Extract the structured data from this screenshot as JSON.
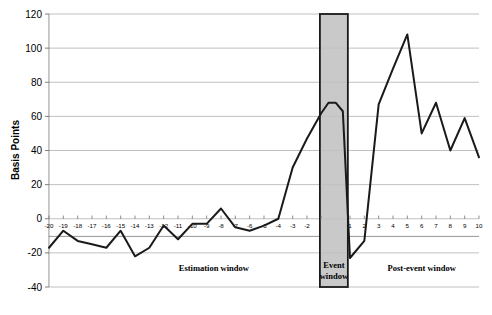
{
  "chart_data": {
    "type": "line",
    "title": "",
    "xlabel": "",
    "ylabel": "Basis Points",
    "xlim": [
      -20,
      10
    ],
    "ylim": [
      -40,
      120
    ],
    "grid": true,
    "legend": "none",
    "ytick_labels": [
      "120",
      "100",
      "80",
      "60",
      "40",
      "20",
      "0",
      "-20",
      "-40"
    ],
    "ytick_values": [
      120,
      100,
      80,
      60,
      40,
      20,
      0,
      -20,
      -40
    ],
    "xtick_labels": [
      "-20",
      "-19",
      "-18",
      "-17",
      "-16",
      "-15",
      "-14",
      "-13",
      "-12",
      "-11",
      "-10",
      "-9",
      "-8",
      "-7",
      "-6",
      "-5",
      "-4",
      "-3",
      "-2",
      "-1",
      "1",
      "2",
      "3",
      "4",
      "5",
      "6",
      "7",
      "8",
      "9",
      "10"
    ],
    "xtick_values": [
      -20,
      -19,
      -18,
      -17,
      -16,
      -15,
      -14,
      -13,
      -12,
      -11,
      -10,
      -9,
      -8,
      -7,
      -6,
      -5,
      -4,
      -3,
      -2,
      -1,
      1,
      2,
      3,
      4,
      5,
      6,
      7,
      8,
      9,
      10
    ],
    "x": [
      -20,
      -19,
      -18,
      -17,
      -16,
      -15,
      -14,
      -13,
      -12,
      -11,
      -10,
      -9,
      -8,
      -7,
      -6,
      -5,
      -4,
      -3,
      -2,
      -1,
      -0.5,
      0,
      0.5,
      1,
      2,
      3,
      4,
      5,
      6,
      7,
      8,
      9,
      10
    ],
    "values": [
      -17,
      -7,
      -13,
      -15,
      -17,
      -7,
      -22,
      -17,
      -4,
      -12,
      -3,
      -3,
      6,
      -5,
      -7,
      -4,
      0,
      30,
      47,
      62,
      68,
      68,
      63,
      -23,
      -13,
      67,
      88,
      108,
      50,
      68,
      40,
      59,
      36
    ],
    "series": [
      {
        "name": "Cumulative abnormal return",
        "values": [
          -17,
          -7,
          -13,
          -15,
          -17,
          -7,
          -22,
          -17,
          -4,
          -12,
          -3,
          -3,
          6,
          -5,
          -7,
          -4,
          0,
          30,
          47,
          62,
          68,
          68,
          63,
          -23,
          -13,
          67,
          88,
          108,
          50,
          68,
          40,
          59,
          36
        ]
      }
    ],
    "annotations": [
      {
        "id": "estimation-window",
        "label": "Estimation window",
        "x_center": -8.5
      },
      {
        "id": "event-window",
        "label": "Event window",
        "label_line1": "Event",
        "label_line2": "window",
        "x_center": 0,
        "x_start": -1.1,
        "x_end": 0.85
      },
      {
        "id": "post-event-window",
        "label": "Post-event window",
        "x_center": 6
      }
    ],
    "shaded_region": {
      "name": "Event window",
      "x_start": -1.1,
      "x_end": 0.85,
      "y_start": -40,
      "y_end": 120,
      "fill_color": "#c9c9c9",
      "border_color": "#1a1a1a"
    },
    "colors": {
      "line": "#1a1a1a",
      "grid": "#b0b0b0",
      "axis": "#7a7a7a",
      "background": "#ffffff"
    }
  }
}
